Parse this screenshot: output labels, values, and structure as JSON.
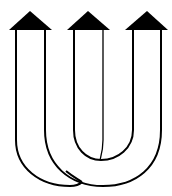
{
  "diagram": {
    "title": "",
    "colors": {
      "line": "#000000",
      "fill": "#000000",
      "background": "#ffffff"
    },
    "arrows": [
      {
        "id": "arrow-left",
        "direction": "up",
        "center_x": 30
      },
      {
        "id": "arrow-middle",
        "direction": "up",
        "center_x": 88
      },
      {
        "id": "arrow-right",
        "direction": "up",
        "center_x": 147
      }
    ],
    "bands": [
      {
        "id": "outer-band-left",
        "connects": [
          "arrow-left",
          "arrow-right"
        ]
      },
      {
        "id": "inner-band",
        "connects": [
          "arrow-middle",
          "arrow-right"
        ]
      }
    ]
  }
}
